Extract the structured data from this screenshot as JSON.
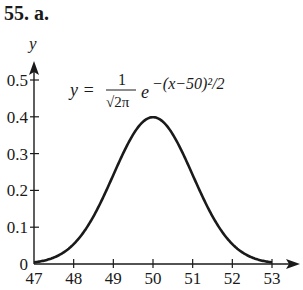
{
  "problem": {
    "label": "55. a."
  },
  "equation": {
    "lhs": "y =",
    "numerator": "1",
    "denominator": "√2π",
    "base": "e",
    "exponent": "−(x−50)²/2"
  },
  "axes": {
    "x_label": "",
    "y_label": "y",
    "x_ticks": [
      "47",
      "48",
      "49",
      "50",
      "51",
      "52",
      "53"
    ],
    "y_ticks": [
      "0",
      "0.1",
      "0.2",
      "0.3",
      "0.4",
      "0.5"
    ]
  },
  "chart_data": {
    "type": "line",
    "title": "",
    "annotation": "y = 1/√(2π) e^(−(x−50)²/2)",
    "xlabel": "",
    "ylabel": "y",
    "xlim": [
      47,
      53
    ],
    "ylim": [
      0,
      0.5
    ],
    "x_ticks": [
      47,
      48,
      49,
      50,
      51,
      52,
      53
    ],
    "y_ticks": [
      0,
      0.1,
      0.2,
      0.3,
      0.4,
      0.5
    ],
    "grid": false,
    "legend": null,
    "series": [
      {
        "name": "normal density, mean 50, sd 1",
        "x": [
          47,
          47.5,
          48,
          48.5,
          49,
          49.5,
          50,
          50.5,
          51,
          51.5,
          52,
          52.5,
          53
        ],
        "y": [
          0.0044,
          0.0175,
          0.054,
          0.1295,
          0.242,
          0.3521,
          0.3989,
          0.3521,
          0.242,
          0.1295,
          0.054,
          0.0175,
          0.0044
        ]
      }
    ]
  }
}
